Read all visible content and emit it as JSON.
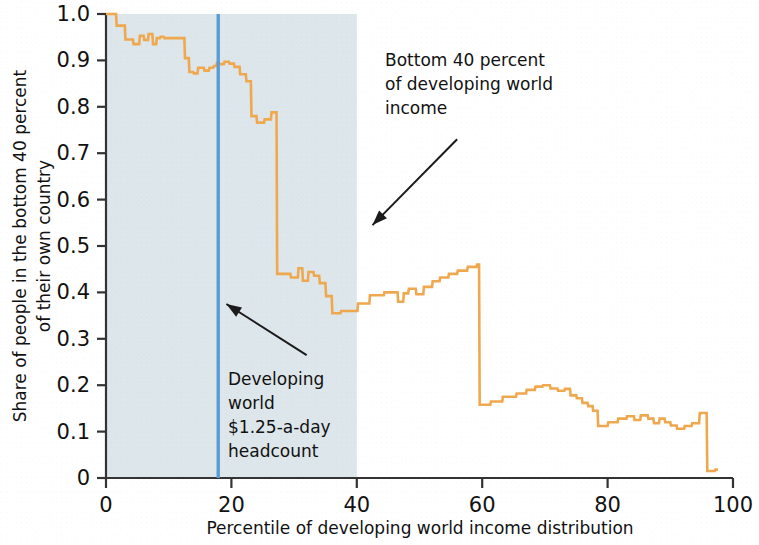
{
  "chart_data": {
    "type": "line",
    "title": "",
    "xlabel": "Percentile of developing world income distribution",
    "ylabel": "Share of people in the bottom 40 percent of their own country",
    "xlim": [
      0,
      100
    ],
    "ylim": [
      0,
      1.0
    ],
    "xticks": [
      "0",
      "20",
      "40",
      "60",
      "80",
      "100"
    ],
    "xtick_values": [
      0,
      20,
      40,
      60,
      80,
      100
    ],
    "yticks": [
      "0",
      "0.1",
      "0.2",
      "0.3",
      "0.4",
      "0.5",
      "0.6",
      "0.7",
      "0.8",
      "0.9",
      "1.0"
    ],
    "ytick_values": [
      0,
      0.1,
      0.2,
      0.3,
      0.4,
      0.5,
      0.6,
      0.7,
      0.8,
      0.9,
      1.0
    ],
    "grid": false,
    "legend": "none",
    "line_color": "#f0a84e",
    "marker_line_color": "#5b9bd5",
    "shaded_region_color": "#dde6ea",
    "shaded_region": {
      "x_start": 0,
      "x_end": 40
    },
    "vertical_marker": {
      "x": 17.9,
      "label": "Developing world $1.25-a-day headcount"
    },
    "annotations": [
      {
        "name": "bottom-40-annotation",
        "lines": [
          "Bottom 40 percent",
          "of developing world",
          "income"
        ],
        "arrow_from": [
          56.0,
          0.73
        ],
        "arrow_to": [
          42.5,
          0.545
        ]
      },
      {
        "name": "headcount-annotation",
        "lines": [
          "Developing",
          "world",
          "$1.25-a-day",
          "headcount"
        ],
        "arrow_from": [
          32.0,
          0.265
        ],
        "arrow_to": [
          19.2,
          0.375
        ]
      }
    ],
    "x": [
      0.0,
      1.6,
      1.7,
      3.0,
      3.1,
      4.3,
      4.4,
      5.3,
      5.4,
      6.0,
      6.1,
      6.7,
      6.8,
      7.4,
      7.5,
      8.0,
      8.1,
      8.6,
      8.7,
      9.2,
      9.3,
      12.5,
      12.6,
      13.2,
      13.3,
      13.9,
      14.0,
      14.6,
      14.7,
      15.6,
      15.7,
      16.4,
      16.5,
      17.1,
      17.2,
      17.6,
      17.7,
      18.0,
      18.1,
      18.8,
      18.9,
      19.6,
      19.7,
      20.4,
      20.5,
      21.3,
      21.4,
      22.3,
      22.4,
      23.1,
      23.2,
      24.0,
      24.1,
      25.2,
      25.3,
      26.3,
      26.4,
      27.2,
      27.3,
      29.4,
      29.5,
      30.6,
      30.7,
      31.3,
      31.4,
      32.2,
      32.3,
      33.1,
      33.2,
      34.0,
      34.1,
      35.0,
      35.1,
      36.0,
      36.1,
      37.4,
      37.5,
      40.1,
      40.2,
      42.0,
      42.1,
      44.3,
      44.4,
      46.5,
      46.6,
      47.4,
      47.5,
      48.2,
      48.3,
      49.4,
      49.5,
      50.6,
      50.7,
      52.0,
      52.1,
      53.2,
      53.3,
      54.6,
      54.7,
      56.0,
      56.1,
      57.6,
      57.7,
      59.1,
      59.2,
      59.5,
      59.6,
      61.3,
      61.4,
      63.2,
      63.3,
      65.4,
      65.5,
      67.0,
      67.1,
      68.4,
      68.5,
      69.6,
      69.7,
      70.8,
      70.9,
      72.0,
      72.1,
      73.1,
      73.2,
      74.0,
      74.1,
      75.0,
      75.1,
      75.9,
      76.0,
      76.8,
      76.9,
      77.6,
      77.7,
      78.4,
      78.5,
      80.0,
      80.1,
      81.6,
      81.7,
      83.0,
      83.1,
      84.2,
      84.3,
      85.2,
      85.3,
      86.4,
      86.5,
      87.3,
      87.4,
      88.2,
      88.3,
      89.1,
      89.2,
      90.0,
      90.1,
      91.0,
      91.1,
      92.2,
      92.3,
      93.4,
      93.5,
      94.6,
      94.7,
      95.8,
      95.9,
      97.1,
      97.2,
      97.6,
      97.7,
      99.0,
      99.1,
      100.0
    ],
    "y": [
      1.0,
      1.0,
      0.975,
      0.975,
      0.945,
      0.945,
      0.935,
      0.935,
      0.953,
      0.953,
      0.944,
      0.944,
      0.957,
      0.957,
      0.935,
      0.935,
      0.948,
      0.948,
      0.951,
      0.951,
      0.948,
      0.948,
      0.905,
      0.905,
      0.875,
      0.875,
      0.872,
      0.872,
      0.884,
      0.884,
      0.878,
      0.878,
      0.884,
      0.884,
      0.888,
      0.888,
      0.895,
      0.895,
      0.892,
      0.892,
      0.897,
      0.897,
      0.893,
      0.893,
      0.886,
      0.886,
      0.87,
      0.87,
      0.855,
      0.855,
      0.78,
      0.78,
      0.766,
      0.766,
      0.773,
      0.773,
      0.788,
      0.788,
      0.44,
      0.44,
      0.432,
      0.432,
      0.452,
      0.452,
      0.425,
      0.425,
      0.444,
      0.444,
      0.436,
      0.436,
      0.42,
      0.42,
      0.392,
      0.392,
      0.355,
      0.355,
      0.36,
      0.36,
      0.376,
      0.376,
      0.394,
      0.394,
      0.4,
      0.4,
      0.38,
      0.38,
      0.398,
      0.398,
      0.408,
      0.408,
      0.396,
      0.396,
      0.412,
      0.412,
      0.424,
      0.424,
      0.432,
      0.432,
      0.44,
      0.44,
      0.447,
      0.447,
      0.455,
      0.455,
      0.46,
      0.46,
      0.158,
      0.158,
      0.165,
      0.165,
      0.175,
      0.175,
      0.182,
      0.182,
      0.19,
      0.19,
      0.197,
      0.197,
      0.2,
      0.2,
      0.193,
      0.193,
      0.188,
      0.188,
      0.192,
      0.192,
      0.178,
      0.178,
      0.172,
      0.172,
      0.162,
      0.162,
      0.155,
      0.155,
      0.145,
      0.145,
      0.112,
      0.112,
      0.12,
      0.12,
      0.128,
      0.128,
      0.133,
      0.133,
      0.125,
      0.125,
      0.135,
      0.135,
      0.128,
      0.128,
      0.118,
      0.118,
      0.128,
      0.128,
      0.12,
      0.12,
      0.113,
      0.113,
      0.106,
      0.106,
      0.112,
      0.112,
      0.118,
      0.118,
      0.14,
      0.14,
      0.015,
      0.015,
      0.018,
      0.018
    ]
  },
  "figure": {
    "background_color": "#ffffff",
    "axis_color": "#333333"
  }
}
